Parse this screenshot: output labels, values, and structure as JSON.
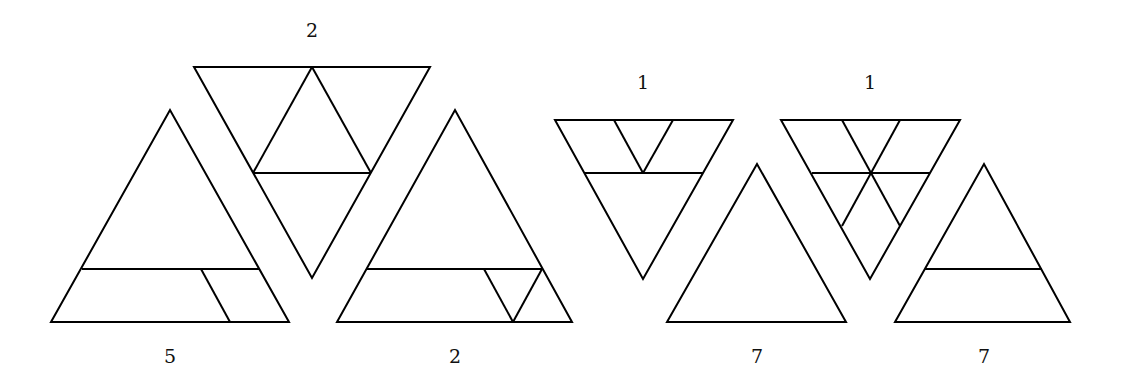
{
  "figure": {
    "triangles": [
      {
        "id": "A",
        "orientation": "up",
        "label": "5",
        "outline": "51,322 170,110 289,322",
        "lines": [
          "82,269 259,269",
          "201,269 230,322"
        ]
      },
      {
        "id": "B",
        "orientation": "down",
        "label": "2",
        "outline": "194,67 430,67 312,278",
        "lines": [
          "253,173 371,173",
          "312,67 253,173",
          "312,67 371,173"
        ]
      },
      {
        "id": "C",
        "orientation": "up",
        "label": "2",
        "outline": "337,322 455,110 572,322",
        "lines": [
          "367,269 542,269",
          "484,269 513,322",
          "513,322 542,269"
        ]
      },
      {
        "id": "D",
        "orientation": "down",
        "label": "1",
        "outline": "555,120 733,120 643,279",
        "lines": [
          "584,173 703,173",
          "614,120 643,173",
          "643,173 673,120"
        ]
      },
      {
        "id": "E",
        "orientation": "up",
        "label": "7",
        "outline": "667,322 757,164 846,322",
        "lines": []
      },
      {
        "id": "F",
        "orientation": "down",
        "label": "1",
        "outline": "781,120 960,120 870,279",
        "lines": [
          "812,173 930,173",
          "842,120 900,226",
          "900,120 842,226"
        ]
      },
      {
        "id": "G",
        "orientation": "up",
        "label": "7",
        "outline": "895,322 984,164 1070,322",
        "lines": [
          "925,269 1042,269"
        ]
      }
    ],
    "labels": [
      {
        "for": "A",
        "text": "5",
        "x": 170,
        "y": 363
      },
      {
        "for": "B",
        "text": "2",
        "x": 312,
        "y": 37
      },
      {
        "for": "C",
        "text": "2",
        "x": 455,
        "y": 363
      },
      {
        "for": "D",
        "text": "1",
        "x": 643,
        "y": 89
      },
      {
        "for": "E",
        "text": "7",
        "x": 757,
        "y": 363
      },
      {
        "for": "F",
        "text": "1",
        "x": 870,
        "y": 89
      },
      {
        "for": "G",
        "text": "7",
        "x": 984,
        "y": 363
      }
    ]
  }
}
